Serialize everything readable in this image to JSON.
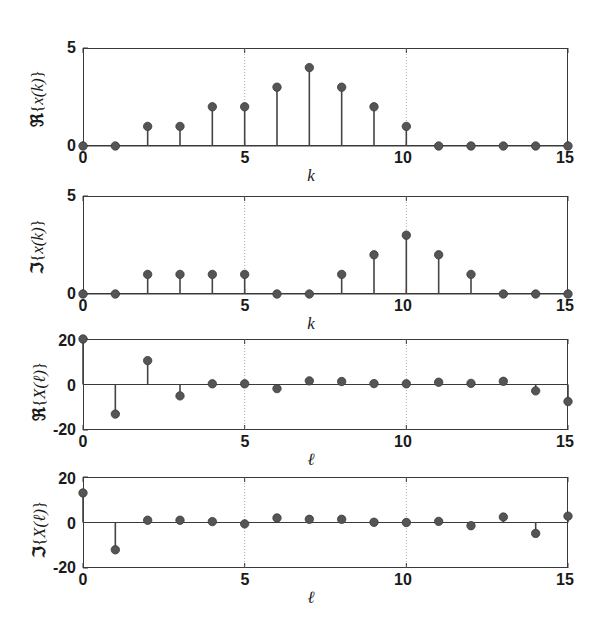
{
  "figure": {
    "background": "#ffffff",
    "marker_color": "#555555",
    "stem_color": "#444444",
    "axis_color": "#3a3a3a",
    "grid_color": "#aaaaaa"
  },
  "chart_data": [
    {
      "type": "stem",
      "panel_index": 0,
      "title": "",
      "ylabel": "ℜ{x(k)}",
      "ylabel_parts": {
        "operator": "ℜ",
        "open": "{",
        "func": "x(k)",
        "close": "}"
      },
      "xlabel": "k",
      "x": [
        0,
        1,
        2,
        3,
        4,
        5,
        6,
        7,
        8,
        9,
        10,
        11,
        12,
        13,
        14,
        15
      ],
      "values": [
        0,
        0,
        1,
        1,
        2,
        2,
        3,
        4,
        3,
        2,
        1,
        0,
        0,
        0,
        0,
        0
      ],
      "xlim": [
        0,
        15
      ],
      "ylim": [
        0,
        5
      ],
      "xticks": [
        0,
        5,
        10,
        15
      ],
      "xticklabels": [
        "0",
        "5",
        "10",
        "15"
      ],
      "yticks": [
        0,
        5
      ],
      "yticklabels": [
        "0",
        "5"
      ],
      "grid": "vertical-dotted-at-5-and-10",
      "legend": null
    },
    {
      "type": "stem",
      "panel_index": 1,
      "title": "",
      "ylabel": "ℑ{x(k)}",
      "ylabel_parts": {
        "operator": "ℑ",
        "open": "{",
        "func": "x(k)",
        "close": "}"
      },
      "xlabel": "k",
      "x": [
        0,
        1,
        2,
        3,
        4,
        5,
        6,
        7,
        8,
        9,
        10,
        11,
        12,
        13,
        14,
        15
      ],
      "values": [
        0,
        0,
        1,
        1,
        1,
        1,
        0,
        0,
        1,
        2,
        3,
        2,
        1,
        0,
        0,
        0
      ],
      "xlim": [
        0,
        15
      ],
      "ylim": [
        0,
        5
      ],
      "xticks": [
        0,
        5,
        10,
        15
      ],
      "xticklabels": [
        "0",
        "5",
        "10",
        "15"
      ],
      "yticks": [
        0,
        5
      ],
      "yticklabels": [
        "0",
        "5"
      ],
      "grid": "vertical-dotted-at-5-and-10",
      "legend": null
    },
    {
      "type": "stem",
      "panel_index": 2,
      "title": "",
      "ylabel": "ℜ{X(ℓ)}",
      "ylabel_parts": {
        "operator": "ℜ",
        "open": "{",
        "func": "X(ℓ)",
        "close": "}"
      },
      "xlabel": "ℓ",
      "x": [
        0,
        1,
        2,
        3,
        4,
        5,
        6,
        7,
        8,
        9,
        10,
        11,
        12,
        13,
        14,
        15
      ],
      "values": [
        20,
        -13,
        10.5,
        -5,
        0.3,
        0.3,
        -1.8,
        1.6,
        1.3,
        0.4,
        0.3,
        1.0,
        0.5,
        1.4,
        -2.8,
        -7.5
      ],
      "xlim": [
        0,
        15
      ],
      "ylim": [
        -20,
        20
      ],
      "xticks": [
        0,
        5,
        10,
        15
      ],
      "xticklabels": [
        "0",
        "5",
        "10",
        "15"
      ],
      "yticks": [
        -20,
        0,
        20
      ],
      "yticklabels": [
        "-20",
        "0",
        "20"
      ],
      "grid": "vertical-dotted-at-5-and-10",
      "legend": null
    },
    {
      "type": "stem",
      "panel_index": 3,
      "title": "",
      "ylabel": "ℑ{X(ℓ)}",
      "ylabel_parts": {
        "operator": "ℑ",
        "open": "{",
        "func": "X(ℓ)",
        "close": "}"
      },
      "xlabel": "ℓ",
      "x": [
        0,
        1,
        2,
        3,
        4,
        5,
        6,
        7,
        8,
        9,
        10,
        11,
        12,
        13,
        14,
        15
      ],
      "values": [
        13,
        -12,
        1.0,
        1.0,
        0.4,
        -0.6,
        2.0,
        1.4,
        1.4,
        0.1,
        0.0,
        0.5,
        -1.4,
        2.4,
        -4.8,
        2.8
      ],
      "xlim": [
        0,
        15
      ],
      "ylim": [
        -20,
        20
      ],
      "xticks": [
        0,
        5,
        10,
        15
      ],
      "xticklabels": [
        "0",
        "5",
        "10",
        "15"
      ],
      "yticks": [
        -20,
        0,
        20
      ],
      "yticklabels": [
        "-20",
        "0",
        "20"
      ],
      "grid": "vertical-dotted-at-5-and-10",
      "legend": null
    }
  ]
}
